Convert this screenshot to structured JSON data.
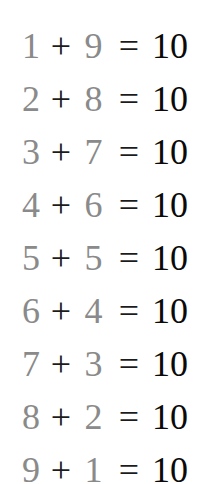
{
  "equations": [
    {
      "a": "1",
      "op": "+",
      "b": "9",
      "eq": "=",
      "result": "10"
    },
    {
      "a": "2",
      "op": "+",
      "b": "8",
      "eq": "=",
      "result": "10"
    },
    {
      "a": "3",
      "op": "+",
      "b": "7",
      "eq": "=",
      "result": "10"
    },
    {
      "a": "4",
      "op": "+",
      "b": "6",
      "eq": "=",
      "result": "10"
    },
    {
      "a": "5",
      "op": "+",
      "b": "5",
      "eq": "=",
      "result": "10"
    },
    {
      "a": "6",
      "op": "+",
      "b": "4",
      "eq": "=",
      "result": "10"
    },
    {
      "a": "7",
      "op": "+",
      "b": "3",
      "eq": "=",
      "result": "10"
    },
    {
      "a": "8",
      "op": "+",
      "b": "2",
      "eq": "=",
      "result": "10"
    },
    {
      "a": "9",
      "op": "+",
      "b": "1",
      "eq": "=",
      "result": "10"
    }
  ],
  "colors": {
    "addend": "#8a8a8a",
    "operator": "#1c1c1c",
    "result": "#0a0a0a"
  }
}
